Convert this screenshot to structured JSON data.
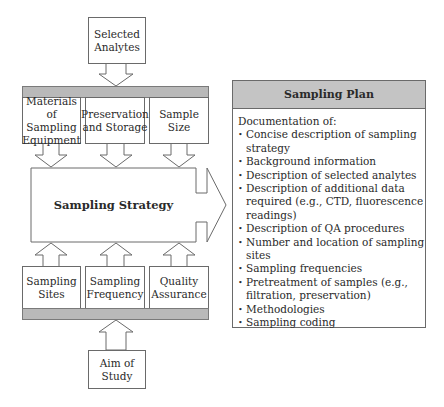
{
  "inputs_top": {
    "label": "Selected Analytes"
  },
  "top_factors": [
    {
      "label": "Materials of Sampling Equipment"
    },
    {
      "label": "Preservation and Storage"
    },
    {
      "label": "Sample Size"
    }
  ],
  "center": {
    "label": "Sampling Strategy"
  },
  "bottom_factors": [
    {
      "label": "Sampling Sites"
    },
    {
      "label": "Sampling Frequency"
    },
    {
      "label": "Quality Assurance"
    }
  ],
  "inputs_bottom": {
    "label": "Aim of Study"
  },
  "plan": {
    "title": "Sampling Plan",
    "intro": "Documentation of:",
    "items": [
      "Concise description of sampling strategy",
      "Background information",
      "Description of selected analytes",
      "Description of additional data required (e.g., CTD, fluorescence readings)",
      "Description of QA procedures",
      "Number and location of sampling sites",
      "Sampling frequencies",
      "Pretreatment of samples (e.g., filtration, preservation)",
      "Methodologies",
      "Sampling coding"
    ]
  },
  "colors": {
    "bar": "#b9b9b9",
    "header": "#c4c4c4",
    "stroke": "#6a6a6a"
  }
}
